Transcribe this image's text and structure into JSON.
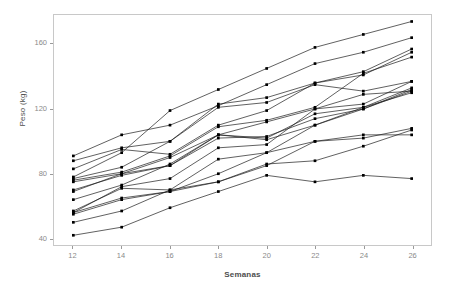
{
  "chart_data": {
    "type": "line",
    "title": "",
    "subtitle": "",
    "xlabel": "Semanas",
    "ylabel": "Peso (kg)",
    "x": [
      12,
      14,
      16,
      18,
      20,
      22,
      24,
      26
    ],
    "xticks": [
      "12",
      "14",
      "16",
      "18",
      "20",
      "22",
      "24",
      "26"
    ],
    "yticks": [
      "40",
      "80",
      "120",
      "160"
    ],
    "ytick_values": [
      40,
      80,
      120,
      160
    ],
    "xlim": [
      11.2,
      26.8
    ],
    "ylim": [
      36,
      178
    ],
    "grid": false,
    "legend": false,
    "legend_position": "none",
    "line_color": "#1a1a1a",
    "marker": "square",
    "marker_color": "#000000",
    "panel_background": "#ffffff",
    "panel_border_color": "#c8c8c8",
    "axis_text_color": "#8a8a8a",
    "series": [
      {
        "name": "sujeto-01",
        "values": [
          78,
          93,
          119,
          132,
          145,
          158,
          166,
          174
        ]
      },
      {
        "name": "sujeto-02",
        "values": [
          91,
          104,
          110,
          122,
          135,
          148,
          155,
          164
        ]
      },
      {
        "name": "sujeto-03",
        "values": [
          88,
          96,
          100,
          123,
          127,
          136,
          143,
          157
        ]
      },
      {
        "name": "sujeto-04",
        "values": [
          83,
          95,
          92,
          110,
          119,
          136,
          141,
          155
        ]
      },
      {
        "name": "sujeto-05",
        "values": [
          76,
          81,
          91,
          109,
          113,
          121,
          142,
          152
        ]
      },
      {
        "name": "sujeto-06",
        "values": [
          75,
          80,
          90,
          104,
          112,
          120,
          123,
          137
        ]
      },
      {
        "name": "sujeto-07",
        "values": [
          70,
          79,
          85,
          104,
          102,
          117,
          121,
          133
        ]
      },
      {
        "name": "sujeto-08",
        "values": [
          69,
          80,
          85,
          102,
          103,
          114,
          120,
          132
        ]
      },
      {
        "name": "sujeto-09",
        "values": [
          64,
          73,
          86,
          104,
          101,
          110,
          120,
          131
        ]
      },
      {
        "name": "sujeto-10",
        "values": [
          56,
          72,
          77,
          96,
          98,
          120,
          129,
          131
        ]
      },
      {
        "name": "sujeto-11",
        "values": [
          57,
          71,
          70,
          89,
          93,
          110,
          121,
          130
        ]
      },
      {
        "name": "sujeto-12",
        "values": [
          55,
          64,
          69,
          80,
          93,
          100,
          102,
          108
        ]
      },
      {
        "name": "sujeto-13",
        "values": [
          50,
          57,
          70,
          75,
          86,
          88,
          97,
          107
        ]
      },
      {
        "name": "sujeto-14",
        "values": [
          42,
          47,
          59,
          69,
          79,
          75,
          79,
          77
        ]
      },
      {
        "name": "sujeto-15",
        "values": [
          56,
          65,
          69,
          75,
          85,
          100,
          104,
          104
        ]
      },
      {
        "name": "sujeto-16",
        "values": [
          77,
          84,
          100,
          121,
          124,
          135,
          131,
          137
        ]
      }
    ]
  }
}
